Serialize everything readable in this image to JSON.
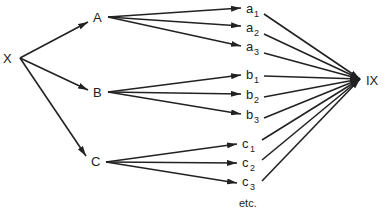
{
  "diagram": {
    "root": {
      "label": "X"
    },
    "level1": [
      {
        "label": "A"
      },
      {
        "label": "B"
      },
      {
        "label": "C"
      }
    ],
    "level2": [
      {
        "base": "a",
        "sub": "1"
      },
      {
        "base": "a",
        "sub": "2"
      },
      {
        "base": "a",
        "sub": "3"
      },
      {
        "base": "b",
        "sub": "1"
      },
      {
        "base": "b",
        "sub": "2"
      },
      {
        "base": "b",
        "sub": "3"
      },
      {
        "base": "c",
        "sub": "1"
      },
      {
        "base": "c",
        "sub": "2"
      },
      {
        "base": "c",
        "sub": "3"
      }
    ],
    "continuation": "etc.",
    "sink": {
      "label": "IX"
    }
  }
}
